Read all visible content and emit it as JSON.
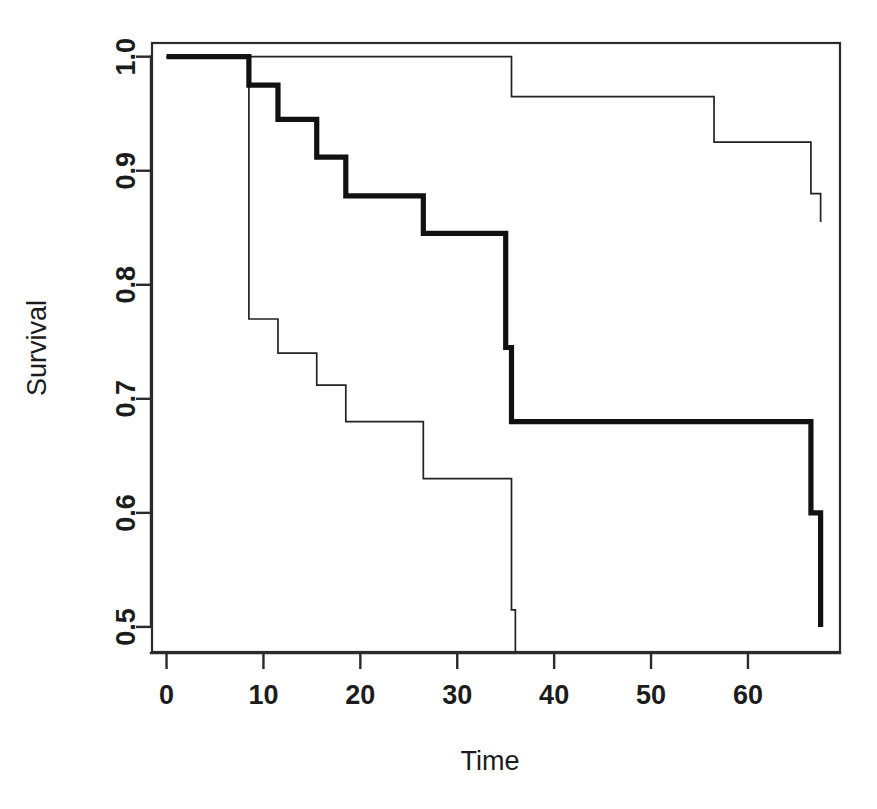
{
  "figure": {
    "title": "",
    "background": "#ffffff",
    "ink": "#111111"
  },
  "axes": {
    "x_title": "Time",
    "y_title": "Survival",
    "x_ticks": [
      "0",
      "10",
      "20",
      "30",
      "40",
      "50",
      "60"
    ],
    "y_ticks": [
      "0.5",
      "0.6",
      "0.7",
      "0.8",
      "0.9",
      "1.0"
    ]
  },
  "chart_data": {
    "type": "line",
    "title": "",
    "xlabel": "Time",
    "ylabel": "Survival",
    "xlim": [
      -1.5,
      69.5
    ],
    "ylim": [
      0.478,
      1.012
    ],
    "xticks": [
      0,
      10,
      20,
      30,
      40,
      50,
      60
    ],
    "yticks": [
      0.5,
      0.6,
      0.7,
      0.8,
      0.9,
      1.0
    ],
    "grid": false,
    "legend": "none",
    "step_style": "post",
    "series": [
      {
        "name": "Kaplan-Meier estimate",
        "role": "estimate",
        "linewidth": "thick",
        "color": "#111111",
        "x": [
          0,
          8.5,
          11.5,
          15.5,
          18.5,
          26.5,
          35.0,
          35.6,
          56.5,
          66.5,
          67.5
        ],
        "y": [
          1.0,
          0.975,
          0.945,
          0.912,
          0.878,
          0.845,
          0.745,
          0.68,
          0.68,
          0.6,
          0.5
        ]
      },
      {
        "name": "Upper confidence limit",
        "role": "upper-ci",
        "linewidth": "thin",
        "color": "#222222",
        "x": [
          0,
          35.0,
          35.6,
          56.5,
          66.5,
          67.5
        ],
        "y": [
          1.0,
          1.0,
          0.965,
          0.925,
          0.88,
          0.855
        ]
      },
      {
        "name": "Lower confidence limit",
        "role": "lower-ci",
        "linewidth": "thin",
        "color": "#222222",
        "x": [
          0,
          8.5,
          11.5,
          15.5,
          18.5,
          26.5,
          35.0,
          35.6,
          36.0
        ],
        "y": [
          1.0,
          0.77,
          0.74,
          0.712,
          0.68,
          0.63,
          0.63,
          0.515,
          0.478
        ]
      }
    ],
    "annotations": []
  },
  "geometry": {
    "plot_left": 152,
    "plot_right": 840,
    "plot_top": 43,
    "plot_bottom": 652,
    "x0_px": 172,
    "px_per_x_unit": 7.08,
    "y1_px": 66,
    "px_per_y_unit": 1130
  }
}
